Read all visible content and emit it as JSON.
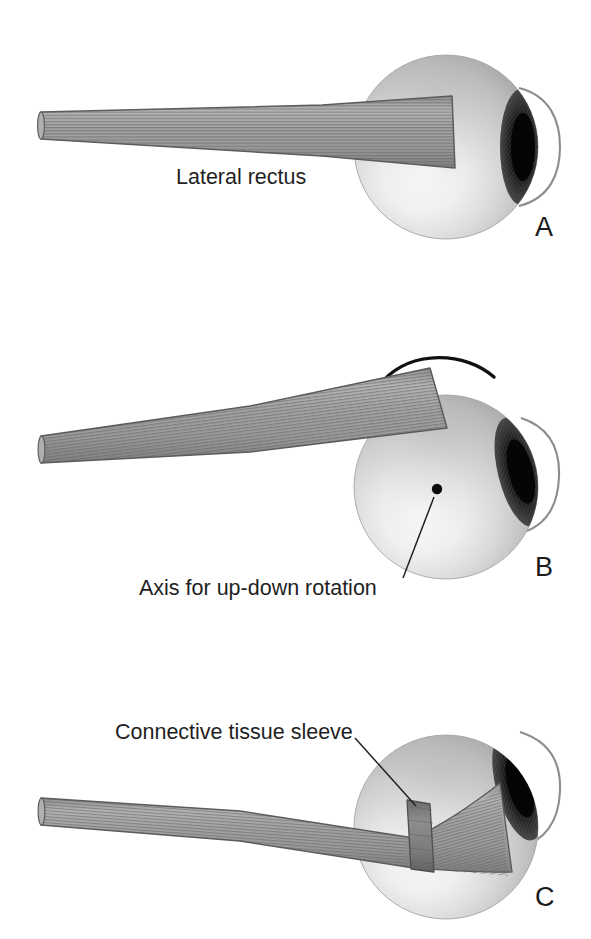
{
  "figure": {
    "background_color": "#ffffff",
    "width": 591,
    "height": 939
  },
  "palette": {
    "muscle_fill": "#9a9a9a",
    "muscle_stripe": "#6e6e6e",
    "muscle_outline": "#4a4a4a",
    "sleeve_fill": "#7c7c7c",
    "globe_light": "#fdfdfd",
    "globe_mid": "#c9c9c9",
    "globe_dark": "#8f8f8f",
    "iris_dark": "#1a1a1a",
    "cornea_outline": "#8a8a8a",
    "ink": "#1b1b1b",
    "leader_line": "#222222"
  },
  "panels": [
    {
      "id": "A",
      "letter": "A",
      "letter_position": {
        "x": 535,
        "y": 214
      },
      "description": "Lateral rectus muscle running straight from orbital apex to the globe; eye in primary position.",
      "globe": {
        "cx": 446,
        "cy": 147,
        "r": 92
      },
      "labels": [
        {
          "name": "lateral-rectus",
          "text": "Lateral rectus",
          "x": 176,
          "y": 167,
          "leader": false
        }
      ]
    },
    {
      "id": "B",
      "letter": "B",
      "letter_position": {
        "x": 535,
        "y": 554
      },
      "description": "Eye rotated upward; muscle path tilts with the globe. Curved arrow shows the direction of rotation and a dot marks the axis for up-down rotation.",
      "globe": {
        "cx": 446,
        "cy": 487,
        "r": 92
      },
      "arrow": {
        "name": "rotation-arrow",
        "direction": "counter-clockwise-left",
        "start": {
          "x": 494,
          "y": 377
        },
        "end": {
          "x": 374,
          "y": 391
        }
      },
      "axis_dot": {
        "x": 437,
        "y": 489,
        "r": 5
      },
      "labels": [
        {
          "name": "axis-for-up-down-rotation",
          "text": "Axis for up-down rotation",
          "x": 139,
          "y": 578,
          "leader": true,
          "leader_from": {
            "x": 403,
            "y": 578
          },
          "leader_to": {
            "x": 435,
            "y": 496
          }
        }
      ]
    },
    {
      "id": "C",
      "letter": "C",
      "letter_position": {
        "x": 535,
        "y": 884
      },
      "description": "Muscle passing through a connective tissue sleeve (pulley) that fixes its path; the muscle bends at the sleeve before inserting on the globe.",
      "globe": {
        "cx": 446,
        "cy": 827,
        "r": 92
      },
      "sleeve": {
        "name": "connective-tissue-sleeve",
        "center": {
          "x": 420,
          "y": 815
        },
        "width": 22,
        "height": 62
      },
      "labels": [
        {
          "name": "connective-tissue-sleeve",
          "text": "Connective tissue sleeve",
          "x": 115,
          "y": 722,
          "leader": true,
          "leader_from": {
            "x": 355,
            "y": 738
          },
          "leader_to": {
            "x": 417,
            "y": 805
          }
        }
      ]
    }
  ]
}
